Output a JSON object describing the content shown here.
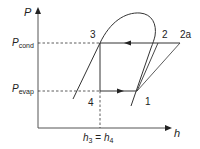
{
  "diagram": {
    "type": "pressure-enthalpy refrigeration cycle",
    "axes": {
      "y_label": "P",
      "x_label": "h"
    },
    "levels": {
      "p_cond": {
        "symbol": "P",
        "subscript": "cond"
      },
      "p_evap": {
        "symbol": "P",
        "subscript": "evap"
      }
    },
    "points": {
      "p1": "1",
      "p2": "2",
      "p2a": "2a",
      "p3": "3",
      "p4": "4"
    },
    "x_annotation": {
      "h3": "h",
      "h3_sub": "3",
      "eq": " = ",
      "h4": "h",
      "h4_sub": "4"
    },
    "colors": {
      "line": "#333333",
      "background": "#ffffff"
    }
  }
}
